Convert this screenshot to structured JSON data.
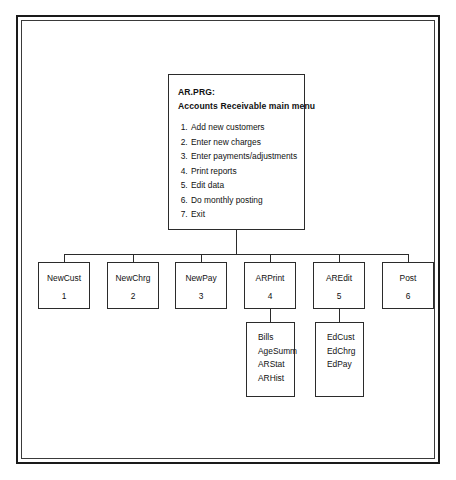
{
  "diagram": {
    "type": "program-structure-chart",
    "root": {
      "title": "AR.PRG:",
      "subtitle": "Accounts Receivable main menu",
      "menu_items": [
        "Add new customers",
        "Enter new charges",
        "Enter payments/adjustments",
        "Print reports",
        "Edit data",
        "Do monthly posting",
        "Exit"
      ]
    },
    "modules": [
      {
        "name": "NewCust",
        "number": "1"
      },
      {
        "name": "NewChrg",
        "number": "2"
      },
      {
        "name": "NewPay",
        "number": "3"
      },
      {
        "name": "ARPrint",
        "number": "4"
      },
      {
        "name": "AREdit",
        "number": "5"
      },
      {
        "name": "Post",
        "number": "6"
      }
    ],
    "submodules": [
      {
        "parent": "ARPrint",
        "items": [
          "Bills",
          "AgeSumm",
          "ARStat",
          "ARHist"
        ]
      },
      {
        "parent": "AREdit",
        "items": [
          "EdCust",
          "EdChrg",
          "EdPay"
        ]
      }
    ]
  },
  "caption": {
    "text": ""
  },
  "colors": {
    "line": "#2b2b2b",
    "frame": "#1a1a1a",
    "text": "#111111",
    "background": "#ffffff"
  }
}
